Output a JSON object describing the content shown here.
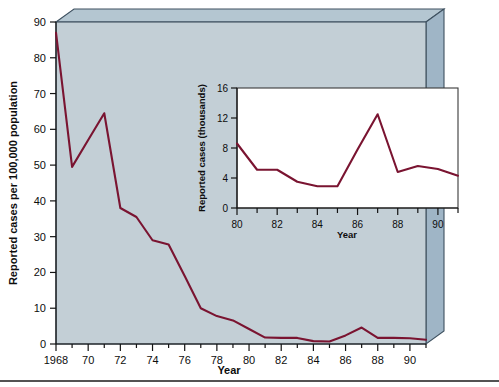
{
  "figure": {
    "background_color": "#ffffff",
    "panel_face_color": "#c3cfd6",
    "panel_side_color": "#9fb5c6",
    "panel_top_color": "#b4c6d1",
    "panel_edge_color": "#3e5160",
    "line_color": "#7a1431",
    "inset_background_color": "#ffffff",
    "text_color": "#0d0d0d",
    "bottom_rule_color": "#1a1a1a"
  },
  "chart_data": {
    "type": "line",
    "title": "",
    "xlabel": "Year",
    "ylabel": "Reported cases per 100,000 population",
    "xlim": [
      1968,
      1991
    ],
    "ylim": [
      0,
      90
    ],
    "grid": false,
    "legend": "none",
    "x_tick_labels": [
      "1968",
      "70",
      "72",
      "74",
      "76",
      "78",
      "80",
      "82",
      "84",
      "86",
      "88",
      "90"
    ],
    "x_tick_values": [
      1968,
      1970,
      1972,
      1974,
      1976,
      1978,
      1980,
      1982,
      1984,
      1986,
      1988,
      1990
    ],
    "y_tick_labels": [
      "0",
      "10",
      "20",
      "30",
      "40",
      "50",
      "60",
      "70",
      "80",
      "90"
    ],
    "y_tick_values": [
      0,
      10,
      20,
      30,
      40,
      50,
      60,
      70,
      80,
      90
    ],
    "x": [
      1968,
      1969,
      1970,
      1971,
      1972,
      1973,
      1974,
      1975,
      1976,
      1977,
      1978,
      1979,
      1980,
      1981,
      1982,
      1983,
      1984,
      1985,
      1986,
      1987,
      1988,
      1989,
      1990,
      1991
    ],
    "values": [
      87.0,
      49.5,
      57.0,
      64.5,
      38.0,
      35.5,
      29.0,
      27.8,
      19.0,
      10.0,
      7.8,
      6.6,
      4.2,
      1.8,
      1.7,
      1.7,
      0.8,
      0.7,
      2.4,
      4.6,
      1.7,
      1.7,
      1.6,
      1.2
    ],
    "series_name": "Reported cases per 100,000 population"
  },
  "inset_chart_data": {
    "type": "line",
    "title": "",
    "xlabel": "Year",
    "ylabel": "Reported cases (thousands)",
    "xlim": [
      1980,
      1991
    ],
    "ylim": [
      0,
      16
    ],
    "grid": false,
    "legend": "none",
    "x_tick_labels": [
      "80",
      "82",
      "84",
      "86",
      "88",
      "90"
    ],
    "x_tick_values": [
      1980,
      1982,
      1984,
      1986,
      1988,
      1990
    ],
    "x_minor_tick_values": [
      1981,
      1983,
      1985,
      1987,
      1989,
      1991
    ],
    "y_tick_labels": [
      "0",
      "4",
      "8",
      "12",
      "16"
    ],
    "y_tick_values": [
      0,
      4,
      8,
      12,
      16
    ],
    "x": [
      1980,
      1981,
      1982,
      1983,
      1984,
      1985,
      1986,
      1987,
      1988,
      1989,
      1990,
      1991
    ],
    "values": [
      8.6,
      5.1,
      5.1,
      3.5,
      2.9,
      2.9,
      7.8,
      12.5,
      4.8,
      5.6,
      5.2,
      4.3
    ],
    "series_name": "Reported cases (thousands)"
  }
}
